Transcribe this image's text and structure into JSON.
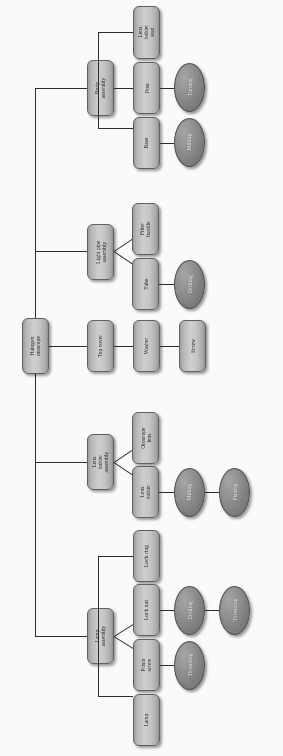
{
  "figure": {
    "type": "assembly-tree-diagram",
    "orientation": "rotated-90-ccw",
    "root_label": "Halogen otoscope",
    "colors": {
      "part_box_fill": "#c6c6c6",
      "part_box_border": "#5f5f5f",
      "process_ellipse_fill": "#7b7b7b",
      "process_ellipse_border": "#4b4b4b",
      "connector_line": "#2a2a2a",
      "background": "#fdfdfd",
      "part_text": "#1b1b1b",
      "process_text": "#f2f2f2"
    }
  },
  "nodes": {
    "root": {
      "label": "Halogen otoscope",
      "kind": "part"
    },
    "body_assembly": {
      "label": "Body assembly",
      "kind": "part"
    },
    "lens_holder_stud": {
      "label": "Lens holder\nstud",
      "kind": "part"
    },
    "post": {
      "label": "Post",
      "kind": "part"
    },
    "base": {
      "label": "Base",
      "kind": "part"
    },
    "turning": {
      "label": "Turning",
      "kind": "process"
    },
    "milling_base": {
      "label": "Milling",
      "kind": "process"
    },
    "light_pipe_assembly": {
      "label": "Light pipe\nassembly",
      "kind": "part"
    },
    "fiber_bundle": {
      "label": "Fiber bundle",
      "kind": "part"
    },
    "tube": {
      "label": "Tube",
      "kind": "part"
    },
    "drilling_tube": {
      "label": "Drilling",
      "kind": "process"
    },
    "top_cover": {
      "label": "Top cover",
      "kind": "part"
    },
    "washer": {
      "label": "Washer",
      "kind": "part"
    },
    "screw": {
      "label": "Screw",
      "kind": "part"
    },
    "lens_holder_assembly": {
      "label": "Lens holder\nassembly",
      "kind": "part"
    },
    "otoscope_lens": {
      "label": "Otoscope\nlens",
      "kind": "part"
    },
    "lens_holder": {
      "label": "Lens holder",
      "kind": "part"
    },
    "milling_lh": {
      "label": "Milling",
      "kind": "process"
    },
    "planing_lh": {
      "label": "Planing",
      "kind": "process"
    },
    "lamp_assembly": {
      "label": "Lamp\nassembly",
      "kind": "part"
    },
    "lock_ring": {
      "label": "Lock ring",
      "kind": "part"
    },
    "lock_nut": {
      "label": "Lock nut",
      "kind": "part"
    },
    "drilling_ln": {
      "label": "Drilling",
      "kind": "process"
    },
    "threading_ln": {
      "label": "Threading",
      "kind": "process"
    },
    "prism_screw": {
      "label": "Prism screw",
      "kind": "part"
    },
    "threading_ps": {
      "label": "Threading",
      "kind": "process"
    },
    "lamp": {
      "label": "Lamp",
      "kind": "part"
    }
  },
  "tree": {
    "Halogen otoscope": [
      "Body assembly",
      "Light pipe assembly",
      "Top cover",
      "Lens holder assembly",
      "Lamp assembly"
    ],
    "Body assembly": [
      "Lens holder stud",
      "Post",
      "Base"
    ],
    "Post": [
      "Turning"
    ],
    "Base": [
      "Milling"
    ],
    "Light pipe assembly": [
      "Fiber bundle",
      "Tube"
    ],
    "Tube": [
      "Drilling"
    ],
    "Top cover": [
      "Washer"
    ],
    "Washer": [
      "Screw"
    ],
    "Lens holder assembly": [
      "Otoscope lens",
      "Lens holder"
    ],
    "Lens holder": [
      "Milling",
      "Planing"
    ],
    "Lamp assembly": [
      "Lock ring",
      "Lock nut",
      "Prism screw",
      "Lamp"
    ],
    "Lock nut": [
      "Drilling",
      "Threading"
    ],
    "Prism screw": [
      "Threading"
    ]
  }
}
